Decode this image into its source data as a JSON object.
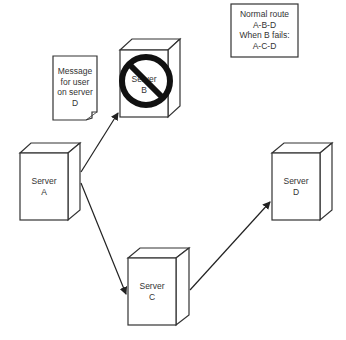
{
  "legend": {
    "lines": [
      "Normal route",
      "A-B-D",
      "When B fails:",
      "A-C-D"
    ]
  },
  "message": {
    "lines": [
      "Message",
      "for user",
      "on server",
      "D"
    ]
  },
  "servers": {
    "a": {
      "line1": "Server",
      "line2": "A"
    },
    "b": {
      "line1": "Server",
      "line2": "B",
      "status": "failed"
    },
    "c": {
      "line1": "Server",
      "line2": "C"
    },
    "d": {
      "line1": "Server",
      "line2": "D"
    }
  },
  "edges": [
    {
      "from": "A",
      "to": "B"
    },
    {
      "from": "A",
      "to": "C"
    },
    {
      "from": "C",
      "to": "D"
    }
  ],
  "colors": {
    "stroke": "#333333",
    "prohibit": "#111111",
    "background": "#ffffff"
  }
}
